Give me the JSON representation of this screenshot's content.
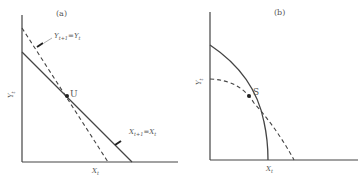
{
  "figure": {
    "panels": [
      {
        "id": "a",
        "title": "(a)",
        "x_axis_label": "X",
        "x_axis_sub": "t",
        "y_axis_label": "Y",
        "y_axis_sub": "t",
        "curves": [
          {
            "name": "X_{t+1}=X_t",
            "style": "solid",
            "label_main": "X",
            "label_sub1": "t+1",
            "label_eq": "=X",
            "label_sub2": "t"
          },
          {
            "name": "Y_{t+1}=Y_t",
            "style": "dashed",
            "label_main": "Y",
            "label_sub1": "t+1",
            "label_eq": "=Y",
            "label_sub2": "t"
          }
        ],
        "point": {
          "label": "U"
        }
      },
      {
        "id": "b",
        "title": "(b)",
        "x_axis_label": "X",
        "x_axis_sub": "t",
        "y_axis_label": "Y",
        "y_axis_sub": "t",
        "curves": [
          {
            "name": "solid-concave-curve",
            "style": "solid"
          },
          {
            "name": "dashed-concave-curve",
            "style": "dashed"
          }
        ],
        "point": {
          "label": "S"
        }
      }
    ],
    "colors": {
      "line": "#444444",
      "text": "#555555",
      "background": "#ffffff"
    }
  }
}
